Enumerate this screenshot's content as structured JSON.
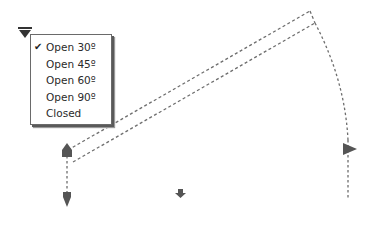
{
  "menu": {
    "trigger_icon": "dropdown-triangle-icon",
    "items": [
      {
        "label": "Open 30º",
        "checked": true,
        "check_glyph": "✔"
      },
      {
        "label": "Open 45º",
        "checked": false,
        "check_glyph": ""
      },
      {
        "label": "Open 60º",
        "checked": false,
        "check_glyph": ""
      },
      {
        "label": "Open 90º",
        "checked": false,
        "check_glyph": ""
      },
      {
        "label": "Closed",
        "checked": false,
        "check_glyph": ""
      }
    ]
  },
  "diagram": {
    "stroke_color": "#6e6e6e",
    "arrow_color": "#5a5a5a",
    "icons": [
      "hinge-handle-icon",
      "arrow-down-icon",
      "small-arrow-down-icon",
      "arrow-right-icon"
    ]
  }
}
